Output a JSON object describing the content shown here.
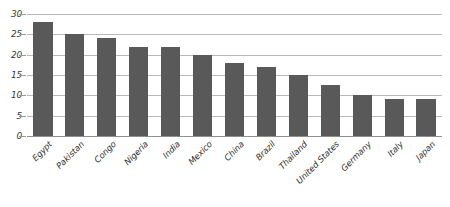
{
  "chart_data": {
    "type": "bar",
    "title": "",
    "subtitle": "",
    "xlabel": "",
    "ylabel": "",
    "ylim": [
      0,
      30
    ],
    "yticks": [
      0,
      5,
      10,
      15,
      20,
      25,
      30
    ],
    "ytick_labels": [
      "0",
      "5",
      "10",
      "15",
      "20",
      "25",
      "30"
    ],
    "grid": true,
    "legend": false,
    "legend_position": "none",
    "orientation": "vertical",
    "bar_color": "#595959",
    "gridline_color": "#b9b9b9",
    "axis_color": "#8f8f8f",
    "categories": [
      "Egypt",
      "Pakistan",
      "Congo",
      "Nigeria",
      "India",
      "Mexico",
      "China",
      "Brazil",
      "Thailand",
      "United States",
      "Germany",
      "Italy",
      "Japan"
    ],
    "values": [
      28,
      25,
      24,
      22,
      22,
      20,
      18,
      17,
      15,
      12.5,
      10,
      9,
      9
    ]
  }
}
